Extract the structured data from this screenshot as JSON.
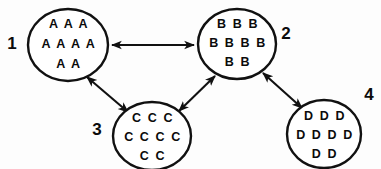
{
  "diagram": {
    "type": "node-link",
    "background_color": "#fdfdfd",
    "stroke_color": "#111111",
    "text_color": "#0b0b0b",
    "nodes": [
      {
        "id": "node-1",
        "label": "1",
        "label_position": "left",
        "label_x": 12,
        "label_y": 45,
        "cx": 68,
        "cy": 45,
        "rx": 40,
        "ry": 36,
        "lines": [
          "A A A",
          "A A A A",
          "A A"
        ],
        "token": "A",
        "token_count": 9
      },
      {
        "id": "node-2",
        "label": "2",
        "label_position": "right",
        "label_x": 286,
        "label_y": 35,
        "cx": 237,
        "cy": 44,
        "rx": 39,
        "ry": 35,
        "lines": [
          "B B B",
          "B B B B",
          "B B"
        ],
        "token": "B",
        "token_count": 9
      },
      {
        "id": "node-3",
        "label": "3",
        "label_position": "left",
        "label_x": 97,
        "label_y": 131,
        "cx": 152,
        "cy": 136,
        "rx": 39,
        "ry": 34,
        "lines": [
          "C C C",
          "C C C C",
          "C C"
        ],
        "token": "C",
        "token_count": 9
      },
      {
        "id": "node-4",
        "label": "4",
        "label_position": "top-right",
        "label_x": 369,
        "label_y": 96,
        "cx": 324,
        "cy": 134,
        "rx": 37,
        "ry": 34,
        "lines": [
          "D D D",
          "D D D D",
          "D D"
        ],
        "token": "D",
        "token_count": 9
      }
    ],
    "edges": [
      {
        "id": "edge-1-2",
        "from": "node-1",
        "to": "node-2",
        "direction": "bidirectional",
        "x1": 112,
        "y1": 45,
        "x2": 194,
        "y2": 45
      },
      {
        "id": "edge-1-3",
        "from": "node-1",
        "to": "node-3",
        "direction": "bidirectional",
        "x1": 86,
        "y1": 76,
        "x2": 127,
        "y2": 111
      },
      {
        "id": "edge-3-2",
        "from": "node-3",
        "to": "node-2",
        "direction": "bidirectional",
        "x1": 178,
        "y1": 110,
        "x2": 214,
        "y2": 76
      },
      {
        "id": "edge-2-4",
        "from": "node-2",
        "to": "node-4",
        "direction": "bidirectional",
        "x1": 263,
        "y1": 72,
        "x2": 301,
        "y2": 107
      }
    ]
  }
}
